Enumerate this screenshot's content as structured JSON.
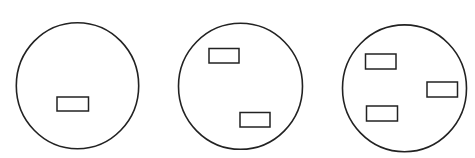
{
  "diagram": {
    "width": 475,
    "height": 158,
    "background": "#ffffff",
    "stroke_color": "#222222",
    "circle_stroke_width": 1.6,
    "rect_stroke_width": 1.5,
    "panels": [
      {
        "id": "panel-1",
        "rect_count": 1,
        "circle": {
          "cx": 77.5,
          "cy": 85.7,
          "rx": 61.2,
          "ry": 63
        },
        "rects": [
          {
            "x": 57,
            "y": 97,
            "w": 31.5,
            "h": 14
          }
        ]
      },
      {
        "id": "panel-2",
        "rect_count": 2,
        "circle": {
          "cx": 240.5,
          "cy": 86.3,
          "rx": 62,
          "ry": 63
        },
        "rects": [
          {
            "x": 209,
            "y": 48.5,
            "w": 30,
            "h": 14.5
          },
          {
            "x": 240,
            "y": 112.5,
            "w": 30,
            "h": 14.5
          }
        ]
      },
      {
        "id": "panel-3",
        "rect_count": 3,
        "circle": {
          "cx": 404.5,
          "cy": 88.3,
          "rx": 62,
          "ry": 63.4
        },
        "rects": [
          {
            "x": 365.5,
            "y": 54,
            "w": 30.5,
            "h": 15
          },
          {
            "x": 427,
            "y": 82,
            "w": 30.5,
            "h": 15
          },
          {
            "x": 366.5,
            "y": 106,
            "w": 31,
            "h": 15
          }
        ]
      }
    ]
  }
}
